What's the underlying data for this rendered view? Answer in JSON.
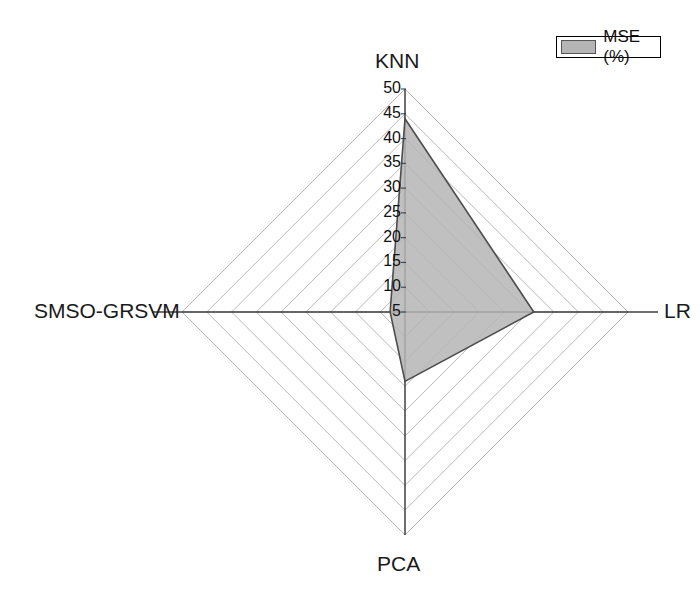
{
  "chart_data": {
    "type": "radar",
    "title": "",
    "categories": [
      "KNN",
      "LR",
      "PCA",
      "SMSO-GRSVM"
    ],
    "series": [
      {
        "name": "MSE (%)",
        "values": [
          44,
          31,
          19,
          8
        ],
        "fill_color": "#b5b5b5",
        "line_color": "#4d4d4d"
      }
    ],
    "radial_ticks": [
      50,
      45,
      40,
      35,
      30,
      25,
      20,
      15,
      10,
      5
    ],
    "rmin": 5,
    "rmax": 50,
    "tick_step": 5,
    "grid": true,
    "grid_color": "#b0b0b0",
    "axis_color": "#333333",
    "legend": {
      "position": "top-right",
      "entries": [
        {
          "label": "MSE (%)",
          "color": "#b5b5b5"
        }
      ]
    },
    "xlabel": "",
    "ylabel": ""
  },
  "axes": {
    "top": "KNN",
    "right": "LR",
    "bottom": "PCA",
    "left": "SMSO-GRSVM"
  },
  "ticks": {
    "t50": "50",
    "t45": "45",
    "t40": "40",
    "t35": "35",
    "t30": "30",
    "t25": "25",
    "t20": "20",
    "t15": "15",
    "t10": "10",
    "t5": "5"
  },
  "legend": {
    "label": "MSE (%)"
  }
}
